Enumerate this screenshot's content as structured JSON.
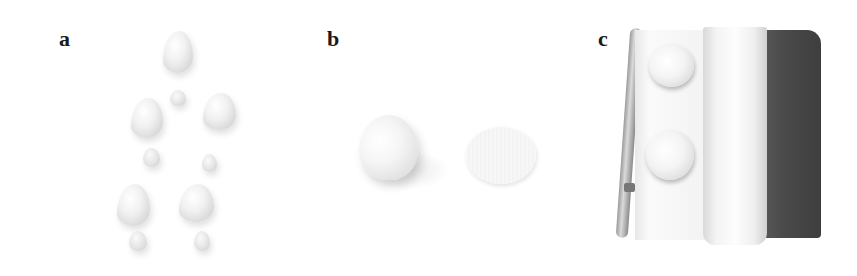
{
  "figure": {
    "panels": [
      {
        "id": "a",
        "label": "a",
        "description": "Rows of piped meringue/cream dollops of varying sizes on white surface"
      },
      {
        "id": "b",
        "label": "b",
        "description": "A domed dollop beside a flattened round disc"
      },
      {
        "id": "c",
        "label": "c",
        "description": "Two piped rounds on parchment paper folded over a baking tray"
      }
    ]
  },
  "colors": {
    "background": "#ffffff",
    "label": "#1a1a1a",
    "tray_mat": "#4a4a4a",
    "paper": "#f5f5f5"
  }
}
